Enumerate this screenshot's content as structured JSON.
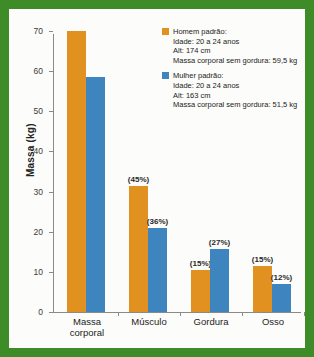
{
  "chart_data": {
    "type": "bar",
    "title": "",
    "subtitle": "",
    "xlabel": "",
    "ylabel": "Massa (kg)",
    "ylim": [
      0,
      70
    ],
    "yticks": [
      0,
      10,
      20,
      30,
      40,
      50,
      60,
      70
    ],
    "grid": false,
    "legend_position": "top-right",
    "categories": [
      "Massa corporal",
      "Músculo",
      "Gordura",
      "Osso"
    ],
    "category_lines": [
      [
        "Massa",
        "corporal"
      ],
      [
        "Músculo"
      ],
      [
        "Gordura"
      ],
      [
        "Osso"
      ]
    ],
    "series": [
      {
        "name": "Homem padrão",
        "color": "#e0911f",
        "values": [
          70.0,
          31.5,
          10.5,
          11.5
        ],
        "labels": [
          "",
          "(45%)",
          "(15%)",
          "(15%)"
        ]
      },
      {
        "name": "Mulher padrão",
        "color": "#3e85c0",
        "values": [
          58.5,
          21.0,
          15.8,
          7.0
        ],
        "labels": [
          "",
          "(36%)",
          "(27%)",
          "(12%)"
        ]
      }
    ]
  },
  "legend": {
    "entries": [
      {
        "swatch": "male",
        "title": "Homem padrão:",
        "lines": [
          "Idade: 20 a 24 anos",
          "Alt: 174 cm",
          "Massa corporal sem gordura: 59,5 kg"
        ]
      },
      {
        "swatch": "female",
        "title": "Mulher padrão:",
        "lines": [
          "Idade: 20 a 24 anos",
          "Alt: 163 cm",
          "Massa corporal sem gordura: 51,5 kg"
        ]
      }
    ]
  },
  "colors": {
    "male": "#e0911f",
    "female": "#3e85c0",
    "border": "#3d8c27",
    "paper": "#fcfcfa",
    "axis": "#8a8a86"
  }
}
